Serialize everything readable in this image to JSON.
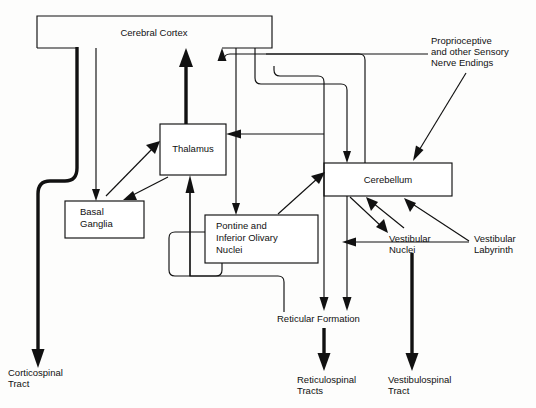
{
  "diagram": {
    "background_color": "#fdfdfc",
    "line_color": "#111111",
    "text_color": "#111111",
    "nodes": [
      {
        "id": "cerebral-cortex",
        "label": "Cerebral Cortex",
        "x": 37,
        "y": 16,
        "w": 235,
        "h": 32
      },
      {
        "id": "thalamus",
        "label": "Thalamus",
        "x": 160,
        "y": 124,
        "w": 66,
        "h": 51
      },
      {
        "id": "basal-ganglia",
        "label_line1": "Basal",
        "label_line2": "Ganglia",
        "x": 65,
        "y": 201,
        "w": 79,
        "h": 37
      },
      {
        "id": "pontine-olivary",
        "label_line1": "Pontine and",
        "label_line2": "Inferior Olivary",
        "label_line3": "Nuclei",
        "x": 205,
        "y": 215,
        "w": 113,
        "h": 48
      },
      {
        "id": "cerebellum",
        "label": "Cerebellum",
        "x": 324,
        "y": 163,
        "w": 128,
        "h": 33
      }
    ],
    "free_labels": [
      {
        "id": "proprioceptive",
        "lines": [
          "Proprioceptive",
          "and other Sensory",
          "Nerve Endings"
        ],
        "x": 431,
        "y": 42
      },
      {
        "id": "vestibular-nuclei",
        "lines": [
          "Vestibular",
          "Nuclei"
        ],
        "x": 389,
        "y": 238
      },
      {
        "id": "vestibular-labyrinth",
        "lines": [
          "Vestibular",
          "Labyrinth"
        ],
        "x": 474,
        "y": 238
      },
      {
        "id": "reticular-formation",
        "lines": [
          "Reticular Formation"
        ],
        "x": 277,
        "y": 320
      },
      {
        "id": "corticospinal-tract",
        "lines": [
          "Corticospinal",
          "Tract"
        ],
        "x": 8,
        "y": 371
      },
      {
        "id": "reticulospinal-tracts",
        "lines": [
          "Reticulospinal",
          "Tracts"
        ],
        "x": 297,
        "y": 378
      },
      {
        "id": "vestibulospinal-tract",
        "lines": [
          "Vestibulospinal",
          "Tract"
        ],
        "x": 388,
        "y": 378
      }
    ],
    "connections": [
      {
        "id": "cortex-to-corticospinal-tract",
        "from": "cerebral-cortex",
        "to": "corticospinal-tract",
        "weight": "thick"
      },
      {
        "id": "cortex-to-basal-ganglia",
        "from": "cerebral-cortex",
        "to": "basal-ganglia",
        "weight": "thin"
      },
      {
        "id": "basal-ganglia-to-thalamus",
        "from": "basal-ganglia",
        "to": "thalamus",
        "weight": "thin"
      },
      {
        "id": "thalamus-to-basal-ganglia",
        "from": "thalamus",
        "to": "basal-ganglia",
        "weight": "thin"
      },
      {
        "id": "thalamus-to-cortex",
        "from": "thalamus",
        "to": "cerebral-cortex",
        "weight": "thick"
      },
      {
        "id": "cortex-to-pontine-olivary",
        "from": "cerebral-cortex",
        "to": "pontine-olivary",
        "weight": "thin"
      },
      {
        "id": "cortex-to-cerebellum",
        "from": "cerebral-cortex",
        "to": "cerebellum",
        "weight": "thin"
      },
      {
        "id": "cerebellum-to-thalamus",
        "from": "cerebellum",
        "to": "thalamus",
        "weight": "thin"
      },
      {
        "id": "cerebellum-to-cortex",
        "from": "cerebellum",
        "to": "cerebral-cortex",
        "weight": "thin"
      },
      {
        "id": "pontine-olivary-to-cerebellum",
        "from": "pontine-olivary",
        "to": "cerebellum",
        "weight": "thin"
      },
      {
        "id": "pontine-olivary-to-thalamus",
        "from": "pontine-olivary",
        "to": "thalamus",
        "weight": "thin"
      },
      {
        "id": "proprioceptive-to-cerebellum",
        "from": "proprioceptive",
        "to": "cerebellum",
        "weight": "thin"
      },
      {
        "id": "cerebellum-to-vestibular-nuclei",
        "from": "cerebellum",
        "to": "vestibular-nuclei",
        "weight": "thin"
      },
      {
        "id": "vestibular-nuclei-to-cerebellum",
        "from": "vestibular-nuclei",
        "to": "cerebellum",
        "weight": "thin"
      },
      {
        "id": "vestibular-labyrinth-to-cerebellum",
        "from": "vestibular-labyrinth",
        "to": "cerebellum",
        "weight": "thin"
      },
      {
        "id": "vestibular-labyrinth-to-vestibular-nuclei",
        "from": "vestibular-labyrinth",
        "to": "vestibular-nuclei",
        "weight": "thin"
      },
      {
        "id": "cerebellum-to-reticular-formation",
        "from": "cerebellum",
        "to": "reticular-formation",
        "weight": "thin"
      },
      {
        "id": "cortex-to-reticular-formation",
        "from": "cerebral-cortex",
        "to": "reticular-formation",
        "weight": "thin"
      },
      {
        "id": "pontine-olivary-to-reticular-formation",
        "from": "pontine-olivary",
        "to": "reticular-formation",
        "weight": "thin"
      },
      {
        "id": "reticular-formation-to-reticulospinal-tracts",
        "from": "reticular-formation",
        "to": "reticulospinal-tracts",
        "weight": "thick"
      },
      {
        "id": "vestibular-nuclei-to-vestibulospinal-tract",
        "from": "vestibular-nuclei",
        "to": "vestibulospinal-tract",
        "weight": "thick"
      }
    ]
  }
}
